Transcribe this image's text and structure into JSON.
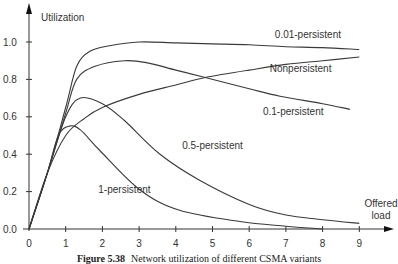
{
  "chart_data": {
    "type": "line",
    "title": "",
    "xlabel": "Offered load",
    "xlabel_lines": [
      "Offered",
      "load"
    ],
    "ylabel": "Utilization",
    "xlim": [
      0,
      9
    ],
    "ylim": [
      0,
      1.0
    ],
    "xticks": [
      0,
      1,
      2,
      3,
      4,
      5,
      6,
      7,
      8,
      9
    ],
    "xtick_labels": [
      "0",
      "1",
      "2",
      "3",
      "4",
      "5",
      "6",
      "7",
      "8",
      "9"
    ],
    "yticks": [
      0.0,
      0.2,
      0.4,
      0.6,
      0.8,
      1.0
    ],
    "ytick_labels": [
      "0.0",
      "0.2",
      "0.4",
      "0.6",
      "0.8",
      "1.0"
    ],
    "grid": false,
    "legend": "inline labels",
    "series": [
      {
        "name": "0.01-persistent",
        "x": [
          0,
          0.5,
          1.0,
          1.3,
          1.66,
          2.2,
          3.0,
          4.0,
          5.0,
          6.0,
          7.0,
          8.0,
          9.0
        ],
        "y": [
          0,
          0.3,
          0.65,
          0.87,
          0.95,
          0.98,
          1.0,
          0.995,
          0.99,
          0.985,
          0.975,
          0.97,
          0.96
        ]
      },
      {
        "name": "Nonpersistent",
        "x": [
          0,
          0.5,
          1.0,
          1.5,
          2.0,
          3.0,
          4.0,
          4.8,
          6.0,
          7.0,
          8.0,
          9.0
        ],
        "y": [
          0,
          0.3,
          0.5,
          0.59,
          0.65,
          0.72,
          0.77,
          0.81,
          0.85,
          0.88,
          0.9,
          0.92
        ]
      },
      {
        "name": "0.1-persistent",
        "x": [
          0,
          0.5,
          1.0,
          1.3,
          1.8,
          2.6,
          3.2,
          4.0,
          4.8,
          6.0,
          6.84,
          8.0,
          8.75
        ],
        "y": [
          0,
          0.3,
          0.62,
          0.8,
          0.87,
          0.9,
          0.89,
          0.85,
          0.81,
          0.75,
          0.71,
          0.67,
          0.64
        ]
      },
      {
        "name": "0.5-persistent",
        "x": [
          0,
          0.5,
          1.0,
          1.4,
          2.0,
          2.6,
          3.57,
          4.66,
          6.02,
          7.0,
          8.0,
          9.0
        ],
        "y": [
          0,
          0.3,
          0.6,
          0.7,
          0.67,
          0.58,
          0.4,
          0.26,
          0.13,
          0.075,
          0.05,
          0.03
        ]
      },
      {
        "name": "1-persistent",
        "x": [
          0,
          0.5,
          0.8,
          1.1,
          1.4,
          1.93,
          3.02,
          4.1,
          5.75,
          7.0,
          8.0
        ],
        "y": [
          0,
          0.3,
          0.5,
          0.55,
          0.53,
          0.42,
          0.21,
          0.1,
          0.04,
          0.015,
          0.0
        ]
      }
    ],
    "annotations": [
      {
        "text": "0.01-persistent",
        "x": 7.6,
        "y": 1.02
      },
      {
        "text": "Nonpersistent",
        "x": 7.4,
        "y": 0.84
      },
      {
        "text": "0.1-persistent",
        "x": 7.2,
        "y": 0.61
      },
      {
        "text": "0.5-persistent",
        "x": 5.0,
        "y": 0.43
      },
      {
        "text": "1-persistent",
        "x": 2.6,
        "y": 0.19
      }
    ]
  },
  "caption": {
    "figure_label": "Figure 5.38",
    "text": "Network utilization of different CSMA variants"
  }
}
